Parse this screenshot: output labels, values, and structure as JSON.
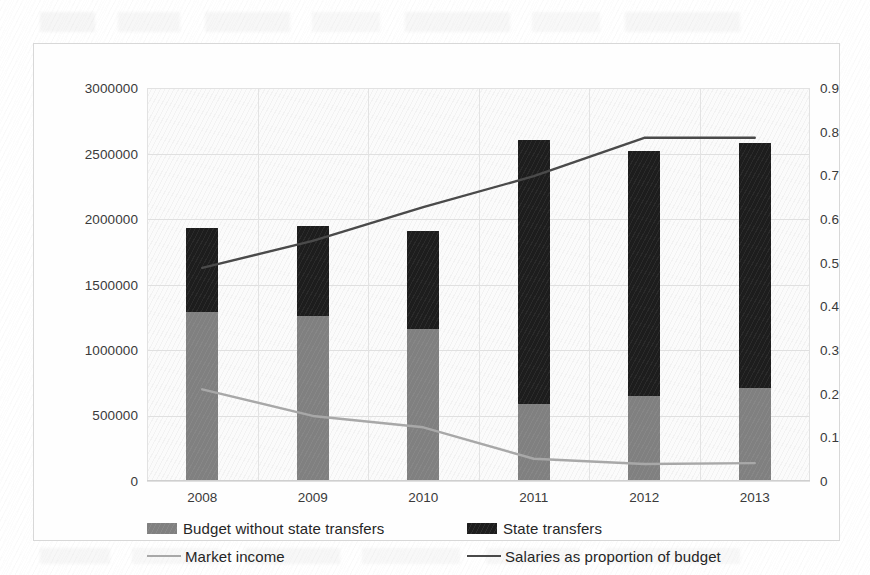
{
  "chart_data": {
    "type": "bar",
    "title": "",
    "subtitle": "",
    "xlabel": "",
    "ylabel": "",
    "categories": [
      "2008",
      "2009",
      "2010",
      "2011",
      "2012",
      "2013"
    ],
    "grid": true,
    "legend_position": "bottom",
    "axes": {
      "left": {
        "label": "",
        "min": 0,
        "max": 3000000,
        "step": 500000,
        "ticks": [
          "0",
          "500000",
          "1000000",
          "1500000",
          "2000000",
          "2500000",
          "3000000"
        ],
        "tick_values": [
          0,
          500000,
          1000000,
          1500000,
          2000000,
          2500000,
          3000000
        ]
      },
      "right": {
        "label": "",
        "min": 0,
        "max": 0.9,
        "step": 0.1,
        "ticks": [
          "0",
          "0.1",
          "0.2",
          "0.3",
          "0.4",
          "0.5",
          "0.6",
          "0.7",
          "0.8",
          "0.9"
        ],
        "tick_values": [
          0,
          0.1,
          0.2,
          0.3,
          0.4,
          0.5,
          0.6,
          0.7,
          0.8,
          0.9
        ]
      }
    },
    "stacked": true,
    "series": [
      {
        "name": "Budget without state transfers",
        "kind": "bar",
        "axis": "left",
        "color": "#808080",
        "values": [
          1290000,
          1260000,
          1160000,
          590000,
          650000,
          710000
        ]
      },
      {
        "name": "State transfers",
        "kind": "bar",
        "axis": "left",
        "color": "#1d1d1d",
        "values": [
          640000,
          690000,
          750000,
          2010000,
          1870000,
          1870000
        ]
      },
      {
        "name": "Market income",
        "kind": "line",
        "axis": "right",
        "color": "#a8a8a8",
        "values": [
          0.21,
          0.149,
          0.123,
          0.051,
          0.039,
          0.041
        ]
      },
      {
        "name": "Salaries as proportion of budget",
        "kind": "line",
        "axis": "right",
        "color": "#4a4a4a",
        "values": [
          0.488,
          0.55,
          0.627,
          0.698,
          0.786,
          0.786
        ]
      }
    ],
    "bar_totals": [
      1930000,
      1950000,
      1910000,
      2600000,
      2520000,
      2580000
    ]
  },
  "legend": {
    "items": [
      {
        "label": "Budget without state transfers",
        "marker": "box",
        "color": "#808080"
      },
      {
        "label": "State transfers",
        "marker": "box",
        "color": "#1d1d1d"
      },
      {
        "label": "Market income",
        "marker": "line",
        "color": "#a8a8a8"
      },
      {
        "label": "Salaries as proportion of budget",
        "marker": "line",
        "color": "#4a4a4a"
      }
    ]
  }
}
